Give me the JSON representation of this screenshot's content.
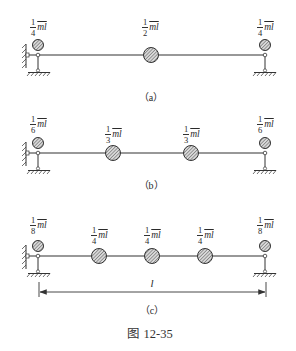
{
  "figure": {
    "caption": "图 12-35",
    "panels": [
      {
        "id": "a",
        "label": "（a）",
        "masses": [
          {
            "num": "1",
            "den": "4",
            "sym": "m̄l",
            "x": 38,
            "size": "small"
          },
          {
            "num": "1",
            "den": "2",
            "sym": "m̄l",
            "x": 151,
            "size": "large"
          },
          {
            "num": "1",
            "den": "4",
            "sym": "m̄l",
            "x": 265,
            "size": "small"
          }
        ]
      },
      {
        "id": "b",
        "label": "（b）",
        "masses": [
          {
            "num": "1",
            "den": "6",
            "sym": "m̄l",
            "x": 38,
            "size": "small"
          },
          {
            "num": "1",
            "den": "3",
            "sym": "m̄l",
            "x": 113,
            "size": "large"
          },
          {
            "num": "1",
            "den": "3",
            "sym": "m̄l",
            "x": 191,
            "size": "large"
          },
          {
            "num": "1",
            "den": "6",
            "sym": "m̄l",
            "x": 265,
            "size": "small"
          }
        ]
      },
      {
        "id": "c",
        "label": "（c）",
        "masses": [
          {
            "num": "1",
            "den": "8",
            "sym": "m̄l",
            "x": 38,
            "size": "small"
          },
          {
            "num": "1",
            "den": "4",
            "sym": "m̄l",
            "x": 99,
            "size": "large"
          },
          {
            "num": "1",
            "den": "4",
            "sym": "m̄l",
            "x": 152,
            "size": "large"
          },
          {
            "num": "1",
            "den": "4",
            "sym": "m̄l",
            "x": 205,
            "size": "large"
          },
          {
            "num": "1",
            "den": "8",
            "sym": "m̄l",
            "x": 265,
            "size": "small"
          }
        ],
        "dimension": {
          "label": "l"
        }
      }
    ]
  },
  "labels": {
    "a_l": {
      "num": "1",
      "den": "4",
      "sym": "ml"
    },
    "a_m": {
      "num": "1",
      "den": "2",
      "sym": "ml"
    },
    "a_r": {
      "num": "1",
      "den": "4",
      "sym": "ml"
    },
    "b_l": {
      "num": "1",
      "den": "6",
      "sym": "ml"
    },
    "b_m1": {
      "num": "1",
      "den": "3",
      "sym": "ml"
    },
    "b_m2": {
      "num": "1",
      "den": "3",
      "sym": "ml"
    },
    "b_r": {
      "num": "1",
      "den": "6",
      "sym": "ml"
    },
    "c_l": {
      "num": "1",
      "den": "8",
      "sym": "ml"
    },
    "c_m1": {
      "num": "1",
      "den": "4",
      "sym": "ml"
    },
    "c_m2": {
      "num": "1",
      "den": "4",
      "sym": "ml"
    },
    "c_m3": {
      "num": "1",
      "den": "4",
      "sym": "ml"
    },
    "c_r": {
      "num": "1",
      "den": "8",
      "sym": "ml"
    }
  },
  "captions": {
    "a": "（a）",
    "b": "（b）",
    "c": "（c）",
    "figure": "图 12-35",
    "dimension": "l"
  }
}
